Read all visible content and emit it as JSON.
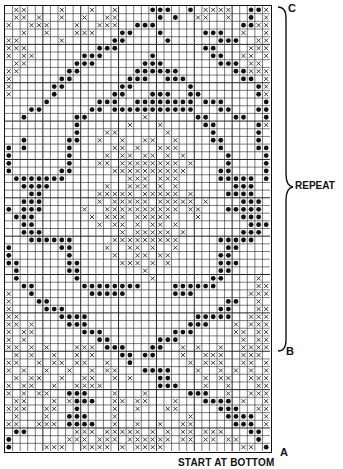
{
  "chart": {
    "cols": 35,
    "rows": 58,
    "legend": {
      "x": "contrast stitch (cross)",
      "o": "dot stitch",
      ".": "plain"
    },
    "rows_data": [
      ".xx....x...x..x....ooo..o.xxxx..oox",
      ".xx.x..x..x..xx.....o.o..xx..x..o.x",
      "x..xxx...x..xxx..ooo...........ooxx",
      "..x..x...xxx...oo...o.....ooo..x..x",
      "xx.....x......oo.....o......ooo..xx",
      "xxx.........ooo...........oo....xxx",
      "x.xx......ooo......o.......oo..xx.x",
      ".xx......ooo......ooo.......ooo.xx.",
      "xx......oo.......oooooo.......ooxxx",
      "x......oo.......ooo..ooo.......oo.x",
      "x.....oo.......oo.......o........ox",
      "x.....o.......oo...ooo..oo.......ox",
      ".....o......ooo..oooooooo.ooo.....o",
      "...oo......oo.ooooooooooo...oo...oo",
      "..o......oo.......x......oo...oo..o",
      ".........o......x...x.....oo.....ox",
      ".........o...xx......x.....o.....o.",
      "..o.....oo..x..x..xx..x....oo....o.",
      "o.o.....o.....xx.x..xxx.....o....oo",
      "o.......o....x.xx.xx.x.x.....o....o",
      "o.......o...xx.xxxxxxxx.x....o....o",
      "o......oo.....xxxxxxxxxx....oo....o",
      ".ooooooo........xxx.xxx.....ooooo.o",
      "..oooo.......x..xxx.x.x.......ooo..",
      "...oo.......xxxxx.xxxxx.x....oooo..",
      "..ooo.......x.xxxxx.xxxxx.x....ooo.",
      "o.ooo.....x..xxxxxxxxxx.xx...ooooo.",
      ".ooo.......x.xxx.xxxxx...x.....ooo.",
      "..oo........x.xx.x.xx.x.........ooo",
      "..ooo..........x.xxxxx.x.......ooo.",
      "...oooooo.....xxxxxxxxx.....ooooo..",
      "o......oo....x..xx.x..x......oo....",
      "o.......o.....x..xx.xx......oo.....",
      "oo......oo.....xxx.x.x......ooo....",
      ".o......oo........x.........oo.....",
      ".o.......o.........x.......oo....x.",
      "..oo......oooooooo....oooooo.....xx",
      "x..o.......ooooo......ooo.......xxx",
      "x...oo.......................oo..x.",
      "x....ooo....................oo...xx",
      "xx.....oooo..............ooooo..xxx",
      "xx.x....ooo.............ooo...x.xxx",
      "x.xx......ooo.........ooo.....xx.xx",
      "x.x.........oo......ooo........x.xx",
      "xx.x.x...xxx.ooo...oo..x.x..x..xxxx",
      ".x.x..x..x.x...oo.oo...x..xxx..xxx.",
      "xx..x.xx.xx..x..o.......x.xxx..xx.x",
      "x.x..x..x..x.xx...oooo...x..x.x.x.x",
      ".x.xx..x..xx..x.x...oo....x.xx..xxx",
      "x.xx..x..xxxx.......ooo...x..x...xx",
      "x.x.xx..ooo...x...x.....ooo..x..xxx",
      ".xx...x.xooo..xx.xx...x...oooo.x..x",
      "xxx..xx..o....x..x...xx.....ooo..xx",
      ".x...x..ooo...x.........x....oooo.x",
      "xx..xxx.oooo..x..x..x..xx.....ooo.x",
      ".oo......xxx.xxxxx.x.x.xx.xxx...oo.",
      "o.......xxx.xxx.xxxxxx.xx.xx.xx..o.",
      "o....xxx..xxxx.x.xxxx..........xx.o"
    ]
  },
  "labels": {
    "top_marker": "C",
    "middle_marker": "B",
    "bottom_marker": "A",
    "repeat": "REPEAT",
    "start": "START AT BOTTOM"
  }
}
